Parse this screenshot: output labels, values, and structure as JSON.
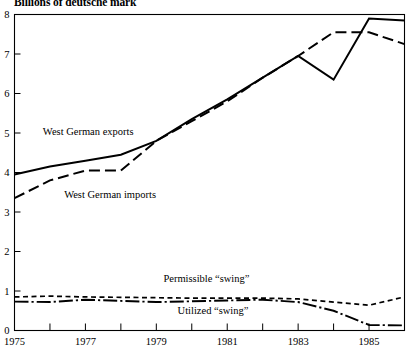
{
  "chart_data": {
    "type": "line",
    "title": "Billions of deutsche mark",
    "xlabel": "",
    "ylabel": "",
    "xlim": [
      1975,
      1986
    ],
    "ylim": [
      0,
      8
    ],
    "grid": false,
    "legend_position": "inline-annotations",
    "y_ticks": [
      "0",
      "1",
      "2",
      "3",
      "4",
      "5",
      "6",
      "7",
      "8"
    ],
    "y_tick_values": [
      0,
      1,
      2,
      3,
      4,
      5,
      6,
      7,
      8
    ],
    "x_ticks": [
      "1975",
      "1977",
      "1979",
      "1981",
      "1983",
      "1985"
    ],
    "x_tick_values": [
      1975,
      1977,
      1979,
      1981,
      1983,
      1985
    ],
    "x_minor_tick_values": [
      1976,
      1978,
      1980,
      1982,
      1984,
      1986
    ],
    "x": [
      1975,
      1976,
      1977,
      1978,
      1979,
      1980,
      1981,
      1982,
      1983,
      1984,
      1985,
      1986
    ],
    "series": [
      {
        "name": "West German exports",
        "style": "solid",
        "label": "West German exports",
        "values": [
          3.95,
          4.15,
          4.3,
          4.45,
          4.8,
          5.35,
          5.85,
          6.4,
          6.95,
          6.35,
          7.9,
          7.85
        ]
      },
      {
        "name": "West German imports",
        "style": "long-dash",
        "label": "West German imports",
        "values": [
          3.35,
          3.8,
          4.05,
          4.05,
          4.8,
          5.3,
          5.8,
          6.4,
          6.95,
          7.55,
          7.55,
          7.25
        ]
      },
      {
        "name": "Permissible swing",
        "style": "short-dash",
        "label": "Permissible “swing”",
        "values": [
          0.85,
          0.87,
          0.85,
          0.84,
          0.83,
          0.82,
          0.82,
          0.82,
          0.8,
          0.72,
          0.64,
          0.85
        ]
      },
      {
        "name": "Utilized swing",
        "style": "dash-dot",
        "label": "Utilized “swing”",
        "values": [
          0.73,
          0.72,
          0.78,
          0.75,
          0.72,
          0.74,
          0.76,
          0.78,
          0.72,
          0.5,
          0.14,
          0.13
        ]
      }
    ],
    "annotations": [
      {
        "text": "West German exports",
        "x": 1975.8,
        "y": 4.95,
        "name": "exports-label"
      },
      {
        "text": "West German imports",
        "x": 1976.4,
        "y": 3.35,
        "name": "imports-label"
      },
      {
        "text": "Permissible “swing”",
        "x": 1979.2,
        "y": 1.22,
        "name": "permissible-swing-label"
      },
      {
        "text": "Utilized “swing”",
        "x": 1979.6,
        "y": 0.42,
        "name": "utilized-swing-label"
      }
    ]
  },
  "colors": {
    "ink": "#000000",
    "background": "#ffffff"
  }
}
